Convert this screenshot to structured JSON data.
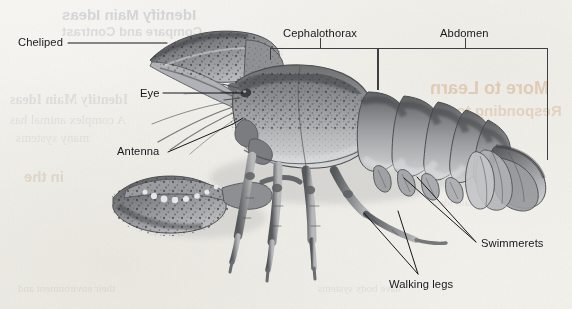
{
  "figure": {
    "background_color": "#f6f5f2",
    "ink_color": "#17181a",
    "label_font_size_px": 11.2
  },
  "labels": [
    {
      "id": "cheliped",
      "text": "Cheliped",
      "x": 18,
      "y": 37,
      "align": "left"
    },
    {
      "id": "eye",
      "text": "Eye",
      "x": 140,
      "y": 88,
      "align": "left"
    },
    {
      "id": "antenna",
      "text": "Antenna",
      "x": 117,
      "y": 146,
      "align": "left"
    },
    {
      "id": "cephalothorax",
      "text": "Cephalothorax",
      "x": 283,
      "y": 28,
      "align": "left"
    },
    {
      "id": "abdomen",
      "text": "Abdomen",
      "x": 440,
      "y": 28,
      "align": "left"
    },
    {
      "id": "swimmerets",
      "text": "Swimmerets",
      "x": 481,
      "y": 238,
      "align": "left"
    },
    {
      "id": "walking_legs",
      "text": "Walking legs",
      "x": 389,
      "y": 279,
      "align": "left"
    }
  ],
  "brackets": [
    {
      "id": "cephalothorax-bracket",
      "label": "Cephalothorax",
      "left": 270,
      "right": 378,
      "top": 48,
      "tick_x": 320,
      "tick_len": 10,
      "left_drop": 12,
      "right_drop": 42
    },
    {
      "id": "abdomen-bracket",
      "label": "Abdomen",
      "left": 378,
      "right": 548,
      "top": 48,
      "tick_x": 465,
      "tick_len": 10,
      "left_drop": 42,
      "right_drop": 112
    }
  ],
  "leaders": [
    {
      "id": "cheliped-leader",
      "from": [
        68,
        43
      ],
      "to": [
        167,
        43
      ]
    },
    {
      "id": "eye-leader",
      "from": [
        163,
        93
      ],
      "to": [
        243,
        93
      ]
    },
    {
      "id": "antenna-leader",
      "from": [
        168,
        152
      ],
      "to": [
        233,
        124
      ]
    },
    {
      "id": "antenna-leader-2",
      "from": [
        233,
        124
      ],
      "to": [
        243,
        118
      ]
    },
    {
      "id": "swimmerets-leader-a",
      "from": [
        476,
        242
      ],
      "to": [
        404,
        178
      ]
    },
    {
      "id": "swimmerets-leader-b",
      "from": [
        476,
        242
      ],
      "to": [
        417,
        177
      ]
    },
    {
      "id": "walkinglegs-leader-a",
      "from": [
        418,
        274
      ],
      "to": [
        364,
        213
      ]
    },
    {
      "id": "walkinglegs-leader-b",
      "from": [
        418,
        274
      ],
      "to": [
        398,
        211
      ]
    }
  ],
  "ghost_text": [
    {
      "text": "Identify Main Ideas",
      "x": 62,
      "y": 6,
      "size": 15,
      "color": "rgba(140,146,154,0.30)",
      "weight": "bold",
      "style": "sans"
    },
    {
      "text": "Compare and Contrast",
      "x": 62,
      "y": 24,
      "size": 13,
      "color": "rgba(146,152,160,0.26)",
      "weight": "bold",
      "style": "sans"
    },
    {
      "text": "Identify Main Ideas",
      "x": 10,
      "y": 92,
      "size": 14,
      "color": "rgba(150,155,162,0.22)",
      "weight": "bold",
      "style": "serif"
    },
    {
      "text": "A complex animal has",
      "x": 10,
      "y": 112,
      "size": 13,
      "color": "rgba(152,157,164,0.20)",
      "weight": "normal",
      "style": "serif"
    },
    {
      "text": "many systems",
      "x": 16,
      "y": 130,
      "size": 13,
      "color": "rgba(152,157,164,0.18)",
      "weight": "normal",
      "style": "serif"
    },
    {
      "text": "in the",
      "x": 24,
      "y": 168,
      "size": 15,
      "color": "rgba(176,150,120,0.26)",
      "weight": "bold",
      "style": "sans"
    },
    {
      "text": "More to Learn",
      "x": 430,
      "y": 78,
      "size": 18,
      "color": "rgba(200,140,86,0.34)",
      "weight": "bold",
      "style": "sans"
    },
    {
      "text": "Responding to the",
      "x": 430,
      "y": 102,
      "size": 15,
      "color": "rgba(196,142,92,0.28)",
      "weight": "bold",
      "style": "sans"
    },
    {
      "text": "their environment and",
      "x": 18,
      "y": 282,
      "size": 11,
      "color": "rgba(158,162,168,0.22)",
      "weight": "normal",
      "style": "serif"
    },
    {
      "text": "have body systems",
      "x": 318,
      "y": 282,
      "size": 11,
      "color": "rgba(158,162,168,0.20)",
      "weight": "normal",
      "style": "serif"
    },
    {
      "text": "Main Ideas",
      "x": 430,
      "y": 196,
      "size": 11,
      "color": "rgba(158,162,168,0.18)",
      "weight": "normal",
      "style": "serif"
    }
  ]
}
